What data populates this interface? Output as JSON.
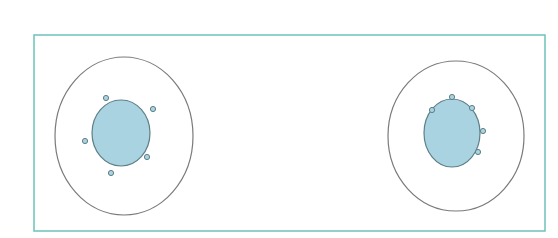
{
  "diagram": {
    "width": 558,
    "height": 238,
    "frame": {
      "x": 34,
      "y": 35,
      "width": 511,
      "height": 196,
      "stroke": "#6cc2b8"
    },
    "colors": {
      "outline": "#7a7a7a",
      "nucleus_fill": "#a9d3e0",
      "nucleus_stroke": "#5f7f88",
      "dot_fill": "#a9d3e0",
      "dot_stroke": "#5f7f88"
    },
    "cells": [
      {
        "id": "left-cell",
        "outer": {
          "cx": 124,
          "cy": 136,
          "rx": 69,
          "ry": 79
        },
        "inner": {
          "cx": 121,
          "cy": 133,
          "rx": 29,
          "ry": 33
        },
        "dots": [
          {
            "cx": 106,
            "cy": 98
          },
          {
            "cx": 153,
            "cy": 109
          },
          {
            "cx": 85,
            "cy": 141
          },
          {
            "cx": 147,
            "cy": 157
          },
          {
            "cx": 111,
            "cy": 173
          }
        ]
      },
      {
        "id": "right-cell",
        "outer": {
          "cx": 456,
          "cy": 136,
          "rx": 68,
          "ry": 75
        },
        "inner": {
          "cx": 452,
          "cy": 133,
          "rx": 28,
          "ry": 34
        },
        "dots": [
          {
            "cx": 432,
            "cy": 110
          },
          {
            "cx": 452,
            "cy": 97
          },
          {
            "cx": 472,
            "cy": 108
          },
          {
            "cx": 483,
            "cy": 131
          },
          {
            "cx": 478,
            "cy": 152
          }
        ]
      }
    ]
  }
}
